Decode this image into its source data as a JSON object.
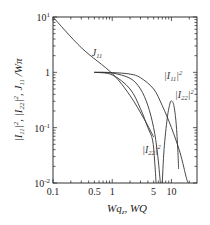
{
  "chart_data": {
    "type": "line",
    "title": "",
    "xlabel": "Wq_z, WQ",
    "ylabel": "|I11|^2, |I22|^2, J11/Wπ",
    "xscale": "log",
    "yscale": "log",
    "xlim": [
      0.1,
      27
    ],
    "ylim": [
      0.01,
      10
    ],
    "x_ticks": [
      {
        "value": 0.1,
        "label": "0.1"
      },
      {
        "value": 0.5,
        "label": "0.5"
      },
      {
        "value": 1,
        "label": "1"
      },
      {
        "value": 5,
        "label": "5"
      },
      {
        "value": 10,
        "label": "10"
      }
    ],
    "y_ticks": [
      {
        "value": 10,
        "label": "10",
        "sup": "1"
      },
      {
        "value": 1,
        "label": "1",
        "sup": ""
      },
      {
        "value": 0.1,
        "label": "10",
        "sup": "-1"
      },
      {
        "value": 0.01,
        "label": "10",
        "sup": "-2"
      }
    ],
    "grid": false,
    "series": [
      {
        "name": "J11",
        "points": [
          [
            0.1,
            10
          ],
          [
            0.3,
            2.8
          ],
          [
            1,
            0.95
          ],
          [
            2,
            0.38
          ],
          [
            3.5,
            0.14
          ],
          [
            5,
            0.068
          ]
        ]
      },
      {
        "name": "|I11|^2",
        "points": [
          [
            0.5,
            1.0
          ],
          [
            1,
            0.99
          ],
          [
            2,
            0.93
          ],
          [
            3,
            0.8
          ],
          [
            5,
            0.5
          ],
          [
            7,
            0.25
          ],
          [
            10,
            0.1
          ],
          [
            14,
            0.035
          ],
          [
            18,
            0.012
          ],
          [
            19.5,
            0.01
          ]
        ]
      },
      {
        "name": "|I22|^2 (main)",
        "points": [
          [
            0.5,
            1.0
          ],
          [
            1,
            0.97
          ],
          [
            2,
            0.78
          ],
          [
            3,
            0.5
          ],
          [
            4,
            0.25
          ],
          [
            5,
            0.1
          ],
          [
            5.8,
            0.035
          ],
          [
            6.5,
            0.01
          ]
        ]
      },
      {
        "name": "|I22|^2 (lower)",
        "points": [
          [
            0.5,
            1.0
          ],
          [
            1,
            0.9
          ],
          [
            2,
            0.5
          ],
          [
            3,
            0.22
          ],
          [
            4,
            0.1
          ],
          [
            4.8,
            0.06
          ],
          [
            5.2,
            0.025
          ],
          [
            5.5,
            0.01
          ]
        ]
      },
      {
        "name": "|I22|^2 (lobe)",
        "points": [
          [
            7,
            0.01
          ],
          [
            7.5,
            0.04
          ],
          [
            8.5,
            0.15
          ],
          [
            9.5,
            0.28
          ],
          [
            10.2,
            0.3
          ],
          [
            11,
            0.25
          ],
          [
            12,
            0.12
          ],
          [
            12.8,
            0.04
          ],
          [
            13.2,
            0.018
          ]
        ]
      }
    ],
    "annotations": [
      {
        "text": "J",
        "sub": "11",
        "sup": "",
        "x": 0.45,
        "y": 2.0
      },
      {
        "text": "|I",
        "sub": "11",
        "sup": "2",
        "x": 7.5,
        "y": 0.75
      },
      {
        "text": "|I",
        "sub": "22",
        "sup": "2",
        "x": 11.5,
        "y": 0.35
      },
      {
        "text": "|I",
        "sub": "22",
        "sup": "2",
        "x": 3.2,
        "y": 0.035
      }
    ]
  }
}
